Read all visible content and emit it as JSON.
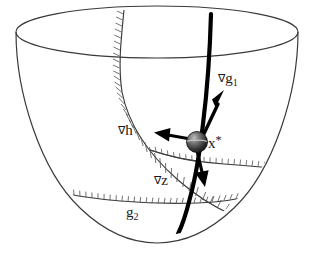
{
  "figure": {
    "type": "geometric-diagram",
    "background_color": "#ffffff",
    "stroke_color": "#2b2b2b",
    "bold_stroke_color": "#000000",
    "hatch_color": "#555555"
  },
  "labels": {
    "grad_g1": {
      "nabla": "∇",
      "var": "g",
      "sub": "1"
    },
    "grad_h": {
      "nabla": "∇",
      "var": "h",
      "sub": ""
    },
    "grad_z": {
      "nabla": "∇",
      "var": "z",
      "sub": ""
    },
    "x_star": {
      "var": "x",
      "star": "*"
    },
    "g2": {
      "var": "g",
      "sub": "2"
    }
  },
  "elements": {
    "bowl": "paraboloid-bowl",
    "rim": "top-elliptical-rim",
    "optimum_point": "x-star-sphere",
    "constraint_g1": "hatched-curve-g1",
    "constraint_g2": "hatched-curve-g2",
    "constraint_h": "equality-constraint-curve",
    "vectors": [
      "grad-g1-arrow",
      "grad-h-arrow",
      "grad-z-arrow"
    ]
  }
}
